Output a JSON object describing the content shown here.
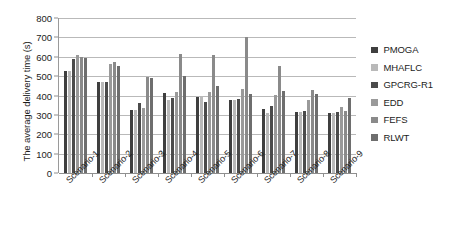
{
  "chart_data": {
    "type": "bar",
    "title": "",
    "subtitle": "",
    "xlabel": "",
    "ylabel": "The average delivery time (s)",
    "ylim": [
      0,
      800
    ],
    "ytick_step": 100,
    "yticks": [
      800,
      700,
      600,
      500,
      400,
      300,
      200,
      100,
      0
    ],
    "grid": true,
    "legend_position": "right",
    "orientation": "vertical",
    "grouped": true,
    "categories": [
      "Scenario-1",
      "Scenario-2",
      "Scenario-3",
      "Scenario-4",
      "Scenario-5",
      "Scenario-6",
      "Scenario-7",
      "Scenario-8",
      "Scenario-9"
    ],
    "series": [
      {
        "name": "PMOGA",
        "color": "#3f3f3f",
        "values": [
          525,
          470,
          327,
          413,
          390,
          378,
          330,
          317,
          312
        ]
      },
      {
        "name": "MHAFLC",
        "color": "#b9b9b9",
        "values": [
          525,
          470,
          327,
          378,
          390,
          378,
          308,
          317,
          312
        ]
      },
      {
        "name": "GPCRG-R1",
        "color": "#4b4b4b",
        "values": [
          590,
          468,
          360,
          388,
          368,
          380,
          345,
          322,
          313
        ]
      },
      {
        "name": "EDD",
        "color": "#9a9a9a",
        "values": [
          608,
          565,
          333,
          418,
          420,
          433,
          403,
          378,
          342
        ]
      },
      {
        "name": "FEFS",
        "color": "#8a8a8a",
        "values": [
          600,
          572,
          497,
          613,
          608,
          703,
          552,
          430,
          322
        ]
      },
      {
        "name": "RLWT",
        "color": "#6e6e6e",
        "values": [
          592,
          551,
          490,
          500,
          450,
          410,
          425,
          408,
          388
        ]
      }
    ]
  },
  "legend": {
    "items": [
      {
        "label": "PMOGA",
        "color": "#3f3f3f"
      },
      {
        "label": "MHAFLC",
        "color": "#b9b9b9"
      },
      {
        "label": "GPCRG-R1",
        "color": "#4b4b4b"
      },
      {
        "label": "EDD",
        "color": "#9a9a9a"
      },
      {
        "label": "FEFS",
        "color": "#8a8a8a"
      },
      {
        "label": "RLWT",
        "color": "#6e6e6e"
      }
    ]
  }
}
